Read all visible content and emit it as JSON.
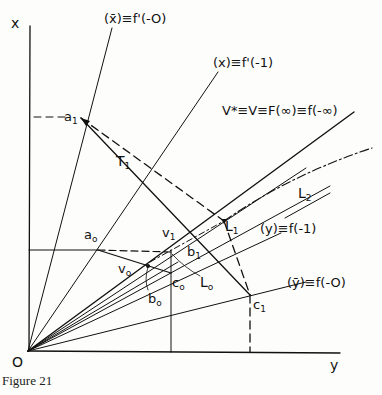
{
  "figure": {
    "caption": "Figure 21",
    "axes": {
      "x_label": "x",
      "y_label": "y",
      "origin_label": "O"
    },
    "rays": {
      "xbar": "(x̄)≡f'(-O)",
      "x": "(x)≡f'(-1)",
      "v_star": "V*≡V≡F(∞)≡f(-∞)",
      "y": "(y)≡f(-1)",
      "ybar": "(ȳ)≡f(-O)"
    },
    "points": {
      "a1": "a",
      "a1_sub": "1",
      "a0": "a",
      "a0_sub": "o",
      "T1": "T",
      "T1_sub": "1",
      "v1": "v",
      "v1_sub": "1",
      "b1": "b",
      "b1_sub": "1",
      "L1": "L",
      "L1_sub": "1",
      "L2": "L",
      "L2_sub": "2",
      "v0": "v",
      "v0_sub": "o",
      "c0": "c",
      "c0_sub": "o",
      "L0": "L",
      "L0_sub": "o",
      "b0": "b",
      "b0_sub": "o",
      "c1": "c",
      "c1_sub": "1"
    }
  }
}
